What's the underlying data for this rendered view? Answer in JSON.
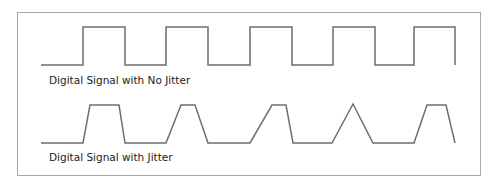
{
  "diagram": {
    "signals": [
      {
        "label": "Digital Signal with No Jitter",
        "stroke": "#6e6e6e",
        "points": "41,65 83,65 83,27 125,27 125,65 166,65 166,27 208,27 208,65 250,65 250,27 292,27 292,65 333,65 333,27 375,27 375,65 414,65 414,27 455,27 455,65"
      },
      {
        "label": "Digital Signal with Jitter",
        "stroke": "#6e6e6e",
        "points": "41,143 83,143 90,105 119,105 125,143 166,143 181,105 195,105 208,143 250,143 272,105 286,105 293,143 332,143 353,104 373,143 414,143 427,105 446,105 455,143"
      }
    ]
  }
}
